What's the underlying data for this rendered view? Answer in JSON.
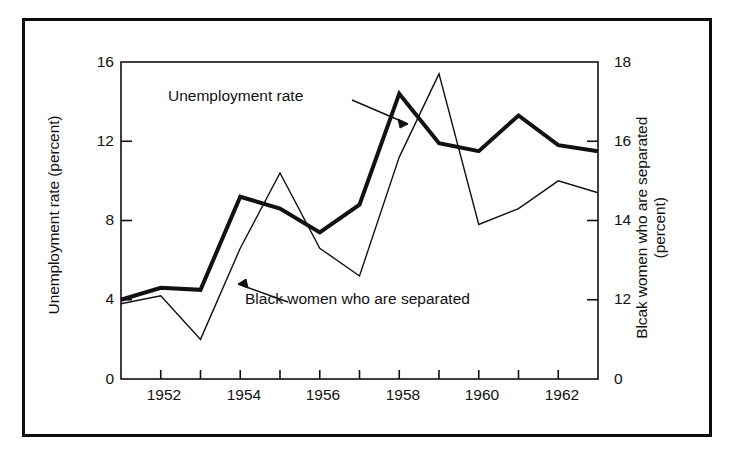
{
  "figure": {
    "background_color": "#ffffff",
    "ink_color": "#111111",
    "border_color": "#0d0d0d"
  },
  "axes": {
    "left": {
      "title": "Unemployment rate (percent)",
      "ticks": [
        "16",
        "12",
        "8",
        "4",
        "0"
      ],
      "min": 0,
      "max": 16
    },
    "right": {
      "title": "Blcak women who are separated (percent)",
      "title_line1": "Blcak women who are separated",
      "title_line2": "(percent)",
      "ticks": [
        "18",
        "16",
        "14",
        "12",
        "0"
      ],
      "min": 10,
      "max": 18
    },
    "bottom": {
      "ticks": [
        "1952",
        "1954",
        "1956",
        "1958",
        "1960",
        "1962"
      ],
      "min": 1951,
      "max": 1963
    }
  },
  "annotations": [
    {
      "name": "unemployment-rate-label",
      "text": "Unemployment rate"
    },
    {
      "name": "black-women-separated-label",
      "text": "Black women who are separated"
    }
  ],
  "chart_data": {
    "type": "line",
    "title": "",
    "subtitle": "",
    "xlabel": "",
    "ylabel": "Unemployment rate (percent)",
    "y2label": "Blcak women who are separated (percent)",
    "grid": false,
    "legend": "annotated-inline",
    "xlim": [
      1951,
      1963
    ],
    "ylim": [
      0,
      16
    ],
    "y2lim": [
      10,
      18
    ],
    "x": [
      1951,
      1952,
      1953,
      1954,
      1955,
      1956,
      1957,
      1958,
      1959,
      1960,
      1961,
      1962,
      1963
    ],
    "series": [
      {
        "name": "Unemployment rate",
        "axis": "left",
        "units": "percent",
        "stroke_width": 4,
        "color": "#111111",
        "values": [
          4.0,
          4.6,
          4.5,
          9.2,
          8.6,
          7.4,
          8.8,
          14.4,
          11.9,
          11.5,
          13.3,
          11.8,
          11.5
        ]
      },
      {
        "name": "Black women who are separated",
        "axis": "right",
        "units": "percent",
        "stroke_width": 1.4,
        "color": "#111111",
        "values": [
          11.9,
          12.1,
          11.0,
          13.3,
          15.2,
          13.3,
          12.6,
          15.6,
          17.7,
          13.9,
          14.3,
          15.0,
          14.7
        ]
      }
    ]
  }
}
